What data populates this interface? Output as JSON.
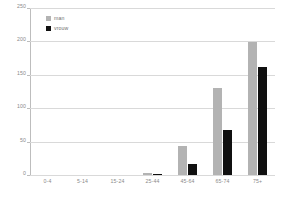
{
  "chart_data": {
    "type": "bar",
    "title": "",
    "xlabel": "",
    "ylabel": "",
    "categories": [
      "0-4",
      "5-14",
      "15-24",
      "25-44",
      "45-64",
      "65-74",
      "75+"
    ],
    "series": [
      {
        "name": "man",
        "color": "#b3b3b3",
        "values": [
          0,
          0,
          0,
          3,
          44,
          131,
          199
        ]
      },
      {
        "name": "vrouw",
        "color": "#101010",
        "values": [
          0,
          0,
          0,
          2,
          16,
          68,
          161
        ]
      }
    ],
    "ylim": [
      0,
      250
    ],
    "yticks": [
      0,
      50,
      100,
      150,
      200,
      250
    ],
    "ytick_labels": [
      "0",
      "50",
      "100",
      "150",
      "200",
      "250"
    ],
    "grid": true,
    "legend_position": "top-left"
  },
  "legend": {
    "items": [
      {
        "label": "man"
      },
      {
        "label": "vrouw"
      }
    ]
  }
}
